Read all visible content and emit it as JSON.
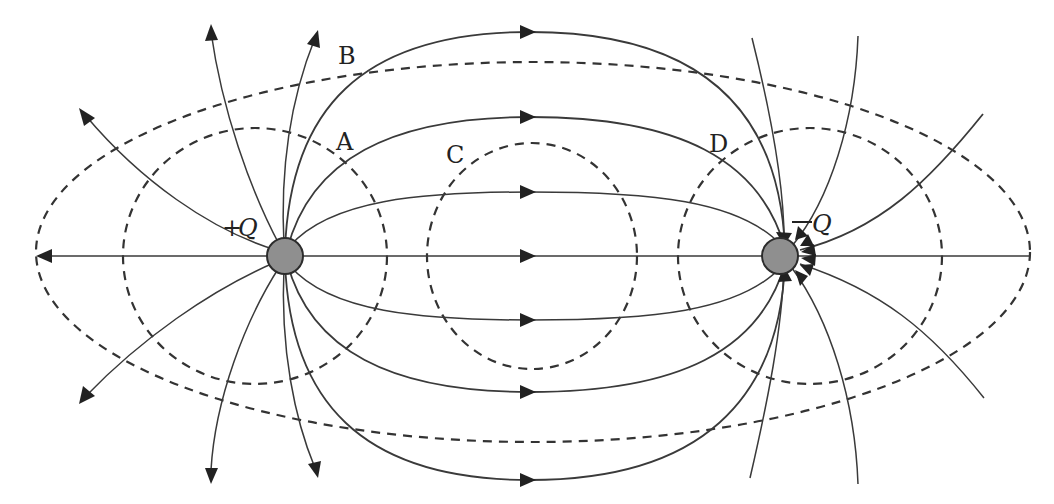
{
  "diagram": {
    "type": "electric-dipole-field-map",
    "charges": [
      {
        "id": "positive",
        "sign": "+",
        "symbol": "Q",
        "label": "+Q",
        "cx": 285,
        "cy": 256
      },
      {
        "id": "negative",
        "sign": "−",
        "symbol": "Q",
        "label": "−Q",
        "cx": 780,
        "cy": 256
      }
    ],
    "points": [
      {
        "id": "A",
        "label": "A",
        "x": 346,
        "y": 150
      },
      {
        "id": "B",
        "label": "B",
        "x": 347,
        "y": 65
      },
      {
        "id": "C",
        "label": "C",
        "x": 455,
        "y": 163
      },
      {
        "id": "D",
        "label": "D",
        "x": 719,
        "y": 152
      }
    ],
    "legend": {
      "solid_lines": "electric field lines (arrows point from +Q to −Q)",
      "dashed_lines": "equipotential surfaces"
    },
    "colors": {
      "line": "#3a3a3a",
      "charge_fill": "#8f8f8f",
      "background": "#ffffff"
    }
  }
}
